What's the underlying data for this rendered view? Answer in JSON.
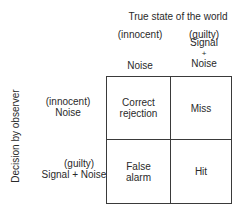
{
  "diagram": {
    "column_header": "True state of the world",
    "columns": [
      {
        "qualifier": "(innocent)",
        "label_lines": [
          "Noise"
        ]
      },
      {
        "qualifier": "(guilty)",
        "label_lines": [
          "Signal",
          "+",
          "Noise"
        ]
      }
    ],
    "row_axis_label": "Decision by observer",
    "rows": [
      {
        "qualifier": "(innocent)",
        "label": "Noise"
      },
      {
        "qualifier": "(guilty)",
        "label": "Signal + Noise"
      }
    ],
    "cells": [
      [
        "Correct rejection",
        "Miss"
      ],
      [
        "False alarm",
        "Hit"
      ]
    ],
    "cell_lines": {
      "r0c0": [
        "Correct",
        "rejection"
      ],
      "r0c1": [
        "Miss"
      ],
      "r1c0": [
        "False",
        "alarm"
      ],
      "r1c1": [
        "Hit"
      ]
    },
    "line_color": "#3a3a3a",
    "text_color": "#2a2a2a"
  }
}
